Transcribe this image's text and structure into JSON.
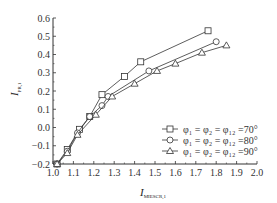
{
  "chart_data": {
    "type": "line",
    "title": "",
    "xlabel": "I",
    "xlabel_sub": "MIESCR,1",
    "ylabel": "I",
    "ylabel_sub": "PR,1",
    "xlim": [
      1.0,
      2.0
    ],
    "ylim": [
      -0.2,
      0.6
    ],
    "xticks": [
      "1.0",
      "1.1",
      "1.2",
      "1.3",
      "1.4",
      "1.5",
      "1.6",
      "1.7",
      "1.8",
      "1.9",
      "2.0"
    ],
    "yticks": [
      "-0.2",
      "-0.1",
      "0.0",
      "0.1",
      "0.2",
      "0.3",
      "0.4",
      "0.5",
      "0.6"
    ],
    "grid": false,
    "legend_position": "lower right",
    "series": [
      {
        "name": "φ1 = φ2 = φ12 = 70°",
        "marker": "square",
        "x": [
          1.02,
          1.07,
          1.13,
          1.18,
          1.24,
          1.35,
          1.43,
          1.76
        ],
        "y": [
          -0.2,
          -0.12,
          -0.01,
          0.06,
          0.18,
          0.28,
          0.36,
          0.53
        ]
      },
      {
        "name": "φ1 = φ2 = φ12 = 80°",
        "marker": "circle",
        "x": [
          1.02,
          1.07,
          1.12,
          1.18,
          1.24,
          1.27,
          1.47,
          1.8
        ],
        "y": [
          -0.2,
          -0.13,
          -0.03,
          0.06,
          0.12,
          0.17,
          0.31,
          0.47
        ]
      },
      {
        "name": "φ1 = φ2 = φ12 = 90°",
        "marker": "triangle",
        "x": [
          1.02,
          1.07,
          1.12,
          1.21,
          1.29,
          1.4,
          1.51,
          1.6,
          1.73,
          1.85
        ],
        "y": [
          -0.2,
          -0.14,
          -0.04,
          0.07,
          0.17,
          0.24,
          0.31,
          0.35,
          0.41,
          0.45
        ]
      }
    ]
  },
  "legend": [
    {
      "text": "φ₁ = φ₂ = φ₁₂ =70°"
    },
    {
      "text": "φ₁ = φ₂ = φ₁₂ =80°"
    },
    {
      "text": "φ₁ = φ₂ = φ₁₂ =90°"
    }
  ]
}
